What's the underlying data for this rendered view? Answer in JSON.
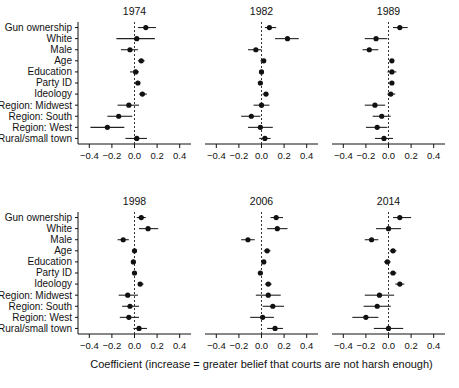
{
  "figure": {
    "axis_caption": "Coefficient (increase = greater belief that courts are not harsh enough)",
    "row_labels": [
      "Gun ownership",
      "White",
      "Male",
      "Age",
      "Education",
      "Party ID",
      "Ideology",
      "Region: Midwest",
      "Region: South",
      "Region: West",
      "Rural/small town"
    ],
    "tick_labels": [
      "−0.4",
      "−0.2",
      "0.0",
      "0.2",
      "0.4"
    ],
    "tick_values": [
      -0.4,
      -0.2,
      0.0,
      0.2,
      0.4
    ],
    "colors": {
      "point": "#111111",
      "line": "#222222",
      "axis": "#111111",
      "zero_reference": "#333333",
      "background": "#ffffff"
    }
  },
  "chart_data": {
    "type": "scatter",
    "title": "",
    "xlabel": "Coefficient (increase = greater belief that courts are not harsh enough)",
    "ylabel": "",
    "xlim": [
      -0.5,
      0.5
    ],
    "grid": false,
    "legend": null,
    "zero_reference_line": 0.0,
    "categories": [
      "Gun ownership",
      "White",
      "Male",
      "Age",
      "Education",
      "Party ID",
      "Ideology",
      "Region: Midwest",
      "Region: South",
      "Region: West",
      "Rural/small town"
    ],
    "panels": [
      {
        "title": "1974",
        "row": 0,
        "col": 0,
        "estimates": [
          0.1,
          0.02,
          -0.04,
          0.06,
          0.01,
          0.03,
          0.07,
          -0.05,
          -0.14,
          -0.24,
          0.02
        ],
        "ci_low": [
          0.03,
          -0.16,
          -0.12,
          0.03,
          -0.04,
          0.0,
          0.04,
          -0.15,
          -0.24,
          -0.39,
          -0.08
        ],
        "ci_high": [
          0.19,
          0.18,
          0.03,
          0.09,
          0.04,
          0.05,
          0.11,
          0.04,
          -0.02,
          -0.09,
          0.11
        ]
      },
      {
        "title": "1982",
        "row": 0,
        "col": 1,
        "estimates": [
          0.07,
          0.23,
          -0.05,
          0.02,
          0.0,
          -0.01,
          0.04,
          0.0,
          -0.09,
          -0.01,
          0.03
        ],
        "ci_low": [
          0.03,
          0.12,
          -0.12,
          -0.01,
          -0.02,
          -0.03,
          0.01,
          -0.07,
          -0.18,
          -0.12,
          -0.02
        ],
        "ci_high": [
          0.13,
          0.33,
          0.0,
          0.04,
          0.02,
          0.01,
          0.06,
          0.07,
          -0.01,
          0.1,
          0.08
        ]
      },
      {
        "title": "1989",
        "row": 0,
        "col": 2,
        "estimates": [
          0.1,
          -0.11,
          -0.17,
          0.03,
          0.03,
          0.03,
          0.02,
          -0.12,
          -0.06,
          -0.1,
          -0.04
        ],
        "ci_low": [
          0.04,
          -0.21,
          -0.23,
          0.01,
          -0.01,
          0.01,
          -0.01,
          -0.21,
          -0.14,
          -0.2,
          -0.12
        ],
        "ci_high": [
          0.17,
          -0.01,
          -0.09,
          0.05,
          0.07,
          0.05,
          0.06,
          -0.03,
          0.02,
          -0.01,
          0.04
        ]
      },
      {
        "title": "1998",
        "row": 1,
        "col": 0,
        "estimates": [
          0.06,
          0.12,
          -0.1,
          0.0,
          -0.01,
          0.0,
          0.05,
          -0.06,
          -0.04,
          -0.05,
          0.04
        ],
        "ci_low": [
          0.02,
          0.04,
          -0.15,
          -0.02,
          -0.03,
          -0.02,
          0.03,
          -0.14,
          -0.11,
          -0.13,
          -0.01
        ],
        "ci_high": [
          0.1,
          0.21,
          -0.05,
          0.02,
          0.01,
          0.02,
          0.08,
          0.03,
          0.04,
          0.04,
          0.11
        ]
      },
      {
        "title": "2006",
        "row": 1,
        "col": 1,
        "estimates": [
          0.13,
          0.14,
          -0.12,
          0.05,
          0.02,
          -0.01,
          0.06,
          0.06,
          0.1,
          0.01,
          0.12
        ],
        "ci_low": [
          0.08,
          0.05,
          -0.18,
          0.02,
          0.0,
          -0.03,
          0.03,
          -0.05,
          0.01,
          -0.1,
          0.05
        ],
        "ci_high": [
          0.19,
          0.23,
          -0.06,
          0.08,
          0.04,
          0.01,
          0.09,
          0.17,
          0.2,
          0.11,
          0.19
        ]
      },
      {
        "title": "2014",
        "row": 1,
        "col": 2,
        "estimates": [
          0.1,
          0.0,
          -0.15,
          0.04,
          -0.01,
          0.04,
          0.1,
          -0.08,
          -0.1,
          -0.2,
          0.0
        ],
        "ci_low": [
          0.04,
          -0.11,
          -0.21,
          0.01,
          -0.04,
          0.01,
          0.06,
          -0.21,
          -0.22,
          -0.32,
          -0.13
        ],
        "ci_high": [
          0.2,
          0.11,
          -0.09,
          0.07,
          0.02,
          0.07,
          0.14,
          0.05,
          0.02,
          -0.09,
          0.13
        ]
      }
    ]
  }
}
